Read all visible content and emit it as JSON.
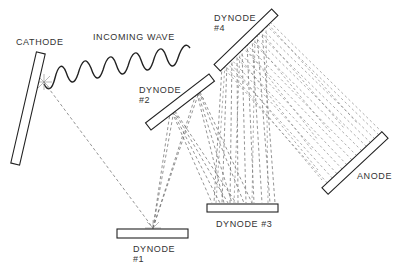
{
  "diagram": {
    "type": "photomultiplier-tube-schematic",
    "labels": {
      "cathode": "CATHODE",
      "incoming_wave": "INCOMING WAVE",
      "dynode1": "DYNODE\n#1",
      "dynode2": "DYNODE\n#2",
      "dynode3": "DYNODE #3",
      "dynode4": "DYNODE\n#4",
      "anode": "ANODE"
    },
    "colors": {
      "line": "#222222",
      "dashed_ray": "#666666",
      "text": "#333333",
      "background": "#ffffff"
    }
  }
}
